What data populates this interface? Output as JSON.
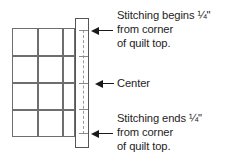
{
  "diagram": {
    "quilt": {
      "name": "quilt top",
      "rows": 4,
      "columns": 3,
      "line_color": "#6e6e6e"
    },
    "binding": {
      "name": "binding strip",
      "outline_color": "#555555",
      "fill_color": "#ffffff"
    },
    "stitching": {
      "name": "stitching line",
      "style": "dashed",
      "color": "#9a9a9a",
      "tick_count": 5
    },
    "callouts": [
      {
        "id": "stitching-begins",
        "lines": [
          "Stitching begins ¼\"",
          "from corner",
          "of quilt top."
        ]
      },
      {
        "id": "center",
        "lines": [
          "Center"
        ]
      },
      {
        "id": "stitching-ends",
        "lines": [
          "Stitching ends ¼\"",
          "from corner",
          "of quilt top."
        ]
      }
    ],
    "arrows": {
      "direction": "left",
      "color": "#1a1a1a",
      "count": 3
    }
  }
}
